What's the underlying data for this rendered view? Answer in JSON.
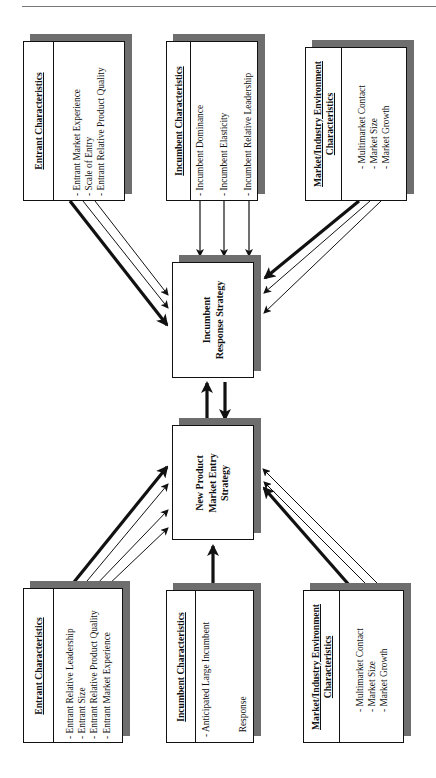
{
  "diagram": {
    "orientation": "rotated 90deg counter-clockwise",
    "center": {
      "incumbent_response": {
        "label_lines": [
          "Incumbent",
          "Response Strategy"
        ]
      },
      "new_product_entry": {
        "label_lines": [
          "New Product",
          "Market Entry",
          "Strategy"
        ]
      }
    },
    "incumbent_side": {
      "entrant": {
        "title": "Entrant Characteristics",
        "items": [
          "- Entrant Market Experience",
          "- Scale of Entry",
          "- Entrant Relative Product Quality"
        ]
      },
      "incumbent": {
        "title": "Incumbent Characteristics",
        "items": [
          "- Incumbent Dominance",
          "- Incumbent Elasticity",
          "- Incumbent Relative Leadership"
        ]
      },
      "market": {
        "title_lines": [
          "Market/Industry Environment",
          "Characteristics"
        ],
        "items": [
          "- Multimarket Contact",
          "- Market Size",
          "- Market Growth"
        ]
      }
    },
    "entry_side": {
      "entrant": {
        "title": "Entrant Characteristics",
        "items": [
          "- Entrant Relative Leadership",
          "- Entrant Size",
          "- Entrant Relative Product Quality",
          "- Entrant Market Experience"
        ]
      },
      "incumbent": {
        "title": "Incumbent Characteristics",
        "items": [
          "- Anticipated Large Incumbent",
          "  Response"
        ]
      },
      "market": {
        "title_lines": [
          "Market/Industry Environment",
          "Characteristics"
        ],
        "items": [
          "- Multimarket Contact",
          "- Market Size",
          "- Market Growth"
        ]
      }
    },
    "colors": {
      "line": "#111111",
      "shadow": "#6e6e6e",
      "background": "#ffffff"
    }
  }
}
